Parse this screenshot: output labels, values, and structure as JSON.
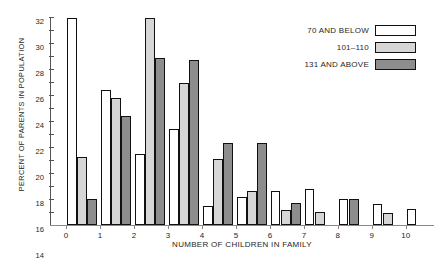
{
  "chart_data": {
    "type": "bar",
    "title": "",
    "xlabel": "NUMBER OF CHILDREN IN FAMILY",
    "ylabel": "PERCENT OF PARENTS IN POPULATION",
    "categories": [
      "0",
      "1",
      "2",
      "3",
      "4",
      "5",
      "6",
      "7",
      "8",
      "9",
      "10"
    ],
    "ylim": [
      0,
      32
    ],
    "yticks": [
      2,
      4,
      6,
      8,
      10,
      12,
      14,
      16,
      18,
      20,
      22,
      24,
      26,
      28,
      30,
      32
    ],
    "grid": false,
    "legend_position": "top-right",
    "series": [
      {
        "name": "70 AND BELOW",
        "color": "#ffffff",
        "values": [
          31.8,
          20.7,
          11.0,
          14.8,
          3.0,
          4.3,
          5.2,
          5.5,
          4.0,
          3.2,
          2.5
        ]
      },
      {
        "name": "101-110",
        "color": "#d6d6d6",
        "values": [
          10.5,
          19.6,
          31.8,
          21.8,
          10.2,
          5.2,
          2.3,
          2.0,
          0,
          1.8,
          0
        ]
      },
      {
        "name": "131 AND ABOVE",
        "color": "#8d8d8d",
        "values": [
          4.0,
          16.8,
          25.7,
          25.4,
          12.6,
          12.6,
          3.4,
          0,
          4.0,
          0,
          0
        ]
      }
    ]
  },
  "legend": {
    "items": [
      {
        "label": "70 AND BELOW",
        "swatch": "#ffffff"
      },
      {
        "label": "101–110",
        "swatch": "#d6d6d6"
      },
      {
        "label": "131 AND ABOVE",
        "swatch": "#8d8d8d"
      }
    ]
  },
  "corner": {
    "mark": ""
  }
}
